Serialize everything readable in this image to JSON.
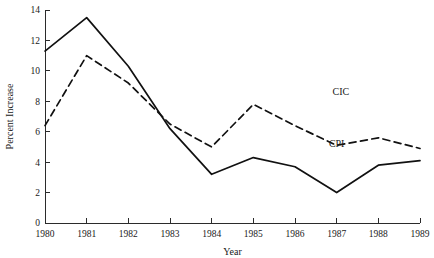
{
  "chart_data": {
    "type": "line",
    "title": "",
    "xlabel": "Year",
    "ylabel": "Percent Increase",
    "categories": [
      1980,
      1981,
      1982,
      1983,
      1984,
      1985,
      1986,
      1987,
      1988,
      1989
    ],
    "x": [
      1980,
      1981,
      1982,
      1983,
      1984,
      1985,
      1986,
      1987,
      1988,
      1989
    ],
    "xlim": [
      1980,
      1989
    ],
    "ylim": [
      0,
      14
    ],
    "yticks": [
      0,
      2,
      4,
      6,
      8,
      10,
      12,
      14
    ],
    "xticks": [
      1980,
      1981,
      1982,
      1983,
      1984,
      1985,
      1986,
      1987,
      1988,
      1989
    ],
    "xtick_labels": [
      "1980",
      "1981",
      "1982",
      "1983",
      "1984",
      "1985",
      "1986",
      "1987",
      "1988",
      "1989"
    ],
    "ytick_labels": [
      "0",
      "2",
      "4",
      "6",
      "8",
      "10",
      "12",
      "14"
    ],
    "grid": false,
    "legend_position": "inline-annotation",
    "series": [
      {
        "name": "CPI",
        "style": "solid",
        "color": "#111111",
        "label_x": 1987.0,
        "label_y": 5.0,
        "values": [
          11.3,
          13.5,
          10.3,
          6.2,
          3.2,
          4.3,
          3.7,
          2.0,
          3.8,
          4.1
        ]
      },
      {
        "name": "CIC",
        "style": "dashed",
        "color": "#111111",
        "label_x": 1987.1,
        "label_y": 8.4,
        "values": [
          6.4,
          11.0,
          9.2,
          6.5,
          5.0,
          7.8,
          6.4,
          5.1,
          5.6,
          4.9
        ]
      }
    ]
  },
  "axes": {
    "y_title": "Percent Increase",
    "x_title": "Year"
  },
  "annotations": {
    "cic_label": "CIC",
    "cpi_label": "CPI"
  }
}
